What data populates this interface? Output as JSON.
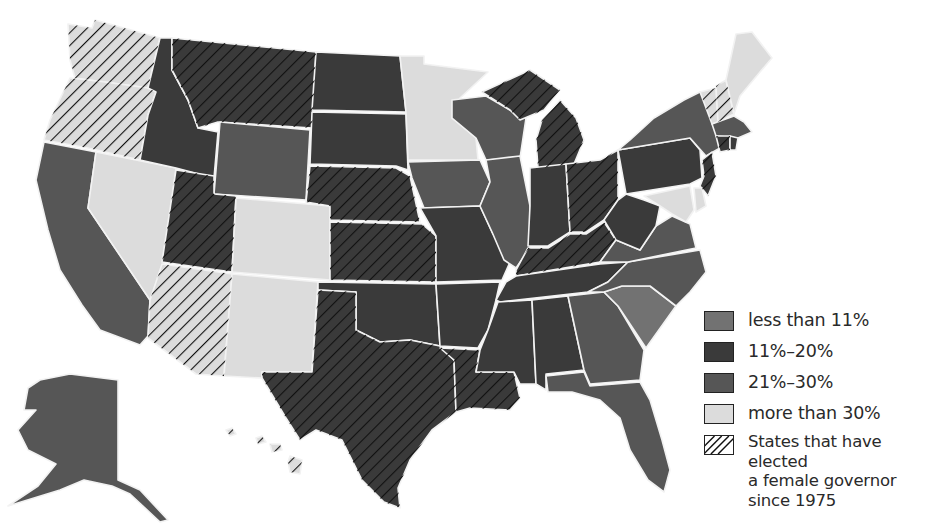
{
  "legend": {
    "items": [
      {
        "key": "lt11",
        "label": "less than 11%",
        "color": "#727272",
        "hatched": false
      },
      {
        "key": "11to20",
        "label": "11%–20%",
        "color": "#3a3a3a",
        "hatched": false
      },
      {
        "key": "21to30",
        "label": "21%–30%",
        "color": "#565656",
        "hatched": false
      },
      {
        "key": "gt30",
        "label": "more than 30%",
        "color": "#dcdcdc",
        "hatched": false
      }
    ],
    "hatch": {
      "line1": "States that have elected",
      "line2": "a female governor",
      "line3": "since 1975"
    }
  },
  "categories": {
    "lt11": "#727272",
    "11to20": "#3a3a3a",
    "21to30": "#565656",
    "gt30": "#dcdcdc"
  },
  "states": [
    {
      "name": "Washington",
      "category": "gt30",
      "female_governor": true
    },
    {
      "name": "Oregon",
      "category": "gt30",
      "female_governor": true
    },
    {
      "name": "California",
      "category": "21to30",
      "female_governor": false
    },
    {
      "name": "Nevada",
      "category": "gt30",
      "female_governor": false
    },
    {
      "name": "Idaho",
      "category": "11to20",
      "female_governor": false
    },
    {
      "name": "Montana",
      "category": "11to20",
      "female_governor": true
    },
    {
      "name": "Wyoming",
      "category": "21to30",
      "female_governor": false
    },
    {
      "name": "Utah",
      "category": "11to20",
      "female_governor": true
    },
    {
      "name": "Arizona",
      "category": "gt30",
      "female_governor": true
    },
    {
      "name": "Colorado",
      "category": "gt30",
      "female_governor": false
    },
    {
      "name": "New Mexico",
      "category": "gt30",
      "female_governor": false
    },
    {
      "name": "North Dakota",
      "category": "11to20",
      "female_governor": false
    },
    {
      "name": "South Dakota",
      "category": "11to20",
      "female_governor": false
    },
    {
      "name": "Nebraska",
      "category": "11to20",
      "female_governor": true
    },
    {
      "name": "Kansas",
      "category": "11to20",
      "female_governor": true
    },
    {
      "name": "Oklahoma",
      "category": "11to20",
      "female_governor": false
    },
    {
      "name": "Texas",
      "category": "11to20",
      "female_governor": true
    },
    {
      "name": "Minnesota",
      "category": "gt30",
      "female_governor": false
    },
    {
      "name": "Iowa",
      "category": "21to30",
      "female_governor": false
    },
    {
      "name": "Missouri",
      "category": "11to20",
      "female_governor": false
    },
    {
      "name": "Arkansas",
      "category": "11to20",
      "female_governor": false
    },
    {
      "name": "Louisiana",
      "category": "11to20",
      "female_governor": true
    },
    {
      "name": "Wisconsin",
      "category": "21to30",
      "female_governor": false
    },
    {
      "name": "Illinois",
      "category": "21to30",
      "female_governor": false
    },
    {
      "name": "Michigan",
      "category": "11to20",
      "female_governor": true
    },
    {
      "name": "Indiana",
      "category": "11to20",
      "female_governor": false
    },
    {
      "name": "Ohio",
      "category": "11to20",
      "female_governor": true
    },
    {
      "name": "Kentucky",
      "category": "11to20",
      "female_governor": true
    },
    {
      "name": "Tennessee",
      "category": "11to20",
      "female_governor": false
    },
    {
      "name": "Mississippi",
      "category": "11to20",
      "female_governor": false
    },
    {
      "name": "Alabama",
      "category": "11to20",
      "female_governor": false
    },
    {
      "name": "Georgia",
      "category": "21to30",
      "female_governor": false
    },
    {
      "name": "Florida",
      "category": "21to30",
      "female_governor": false
    },
    {
      "name": "South Carolina",
      "category": "lt11",
      "female_governor": false
    },
    {
      "name": "North Carolina",
      "category": "21to30",
      "female_governor": false
    },
    {
      "name": "Virginia",
      "category": "21to30",
      "female_governor": false
    },
    {
      "name": "West Virginia",
      "category": "11to20",
      "female_governor": false
    },
    {
      "name": "Pennsylvania",
      "category": "11to20",
      "female_governor": false
    },
    {
      "name": "New York",
      "category": "21to30",
      "female_governor": false
    },
    {
      "name": "Vermont",
      "category": "gt30",
      "female_governor": true
    },
    {
      "name": "New Hampshire",
      "category": "gt30",
      "female_governor": true
    },
    {
      "name": "Maine",
      "category": "gt30",
      "female_governor": false
    },
    {
      "name": "Massachusetts",
      "category": "21to30",
      "female_governor": false
    },
    {
      "name": "Connecticut",
      "category": "11to20",
      "female_governor": true
    },
    {
      "name": "Rhode Island",
      "category": "11to20",
      "female_governor": false
    },
    {
      "name": "New Jersey",
      "category": "11to20",
      "female_governor": true
    },
    {
      "name": "Delaware",
      "category": "gt30",
      "female_governor": false
    },
    {
      "name": "Maryland",
      "category": "gt30",
      "female_governor": false
    },
    {
      "name": "Alaska",
      "category": "21to30",
      "female_governor": false
    },
    {
      "name": "Hawaii",
      "category": "gt30",
      "female_governor": true
    }
  ]
}
